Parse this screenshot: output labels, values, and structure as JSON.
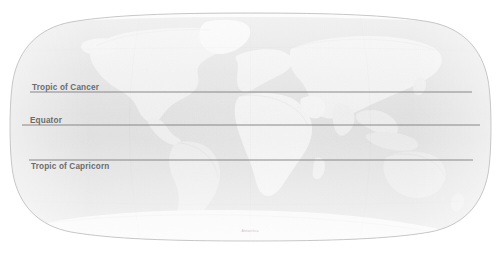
{
  "figure": {
    "name": "world-map",
    "projection": "Robinson",
    "background_color": "#ffffff",
    "ocean_color": "#c9c9c9",
    "land_color": "#e9e9e9",
    "ice_color": "#f4f4f4",
    "outline_color": "#b4b4b4",
    "line_color": "#7d7d7d",
    "label_color": "#6b6b6b"
  },
  "latitude_lines": [
    {
      "id": "tropic-of-cancer",
      "label": "Tropic of Cancer",
      "y": 92,
      "label_x": 32,
      "label_y": 91,
      "line_start_x": 30,
      "line_end_x": 472
    },
    {
      "id": "equator",
      "label": "Equator",
      "y": 125,
      "label_x": 30,
      "label_y": 124,
      "line_start_x": 22,
      "line_end_x": 480
    },
    {
      "id": "tropic-of-capricorn",
      "label": "Tropic of Capricorn",
      "y": 160,
      "label_x": 31,
      "label_y": 169,
      "line_start_x": 29,
      "line_end_x": 473
    }
  ],
  "annotations": {
    "antarctica_note": "Antarctica",
    "corner_note": ""
  }
}
